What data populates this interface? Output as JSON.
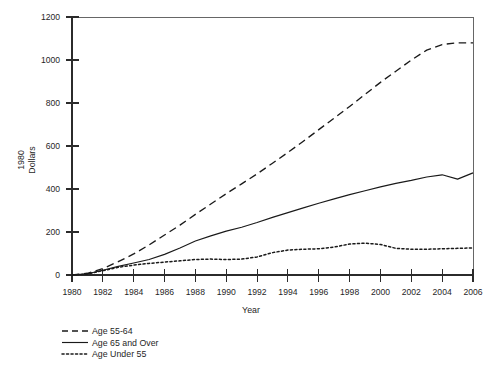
{
  "chart_data": {
    "type": "line",
    "title": "",
    "xlabel": "Year",
    "ylabel": "1980 Dollars",
    "ylabel_lines": [
      "1980",
      "Dollars"
    ],
    "xlim": [
      1980,
      2006
    ],
    "ylim": [
      0,
      1200
    ],
    "grid": false,
    "legend_position": "below-left",
    "xticks": [
      1980,
      1982,
      1984,
      1986,
      1988,
      1990,
      1992,
      1994,
      1996,
      1998,
      2000,
      2002,
      2004,
      2006
    ],
    "xtick_labels": [
      "1980",
      "1982",
      "1984",
      "1986",
      "1988",
      "1990",
      "1992",
      "1994",
      "1996",
      "1998",
      "2000",
      "2002",
      "2004",
      "2006"
    ],
    "yticks": [
      0,
      200,
      400,
      600,
      800,
      1000,
      1200
    ],
    "ytick_labels": [
      "0",
      "200",
      "400",
      "600",
      "800",
      "1000",
      "1200"
    ],
    "x": [
      1980,
      1981,
      1982,
      1983,
      1984,
      1985,
      1986,
      1987,
      1988,
      1989,
      1990,
      1991,
      1992,
      1993,
      1994,
      1995,
      1996,
      1997,
      1998,
      1999,
      2000,
      2001,
      2002,
      2003,
      2004,
      2005,
      2006
    ],
    "series": [
      {
        "name": "Age 55-64",
        "style": "dashed",
        "color": "#1a1a1a",
        "values": [
          0,
          8,
          30,
          62,
          98,
          140,
          186,
          232,
          282,
          330,
          378,
          424,
          470,
          520,
          570,
          622,
          676,
          730,
          784,
          840,
          896,
          948,
          1000,
          1046,
          1072,
          1080,
          1080
        ]
      },
      {
        "name": "Age 65 and Over",
        "style": "solid",
        "color": "#1a1a1a",
        "values": [
          0,
          6,
          22,
          40,
          56,
          72,
          96,
          126,
          158,
          182,
          204,
          222,
          244,
          268,
          290,
          312,
          334,
          354,
          374,
          392,
          410,
          426,
          440,
          456,
          466,
          446,
          475
        ]
      },
      {
        "name": "Age Under 55",
        "style": "dotted",
        "color": "#1a1a1a",
        "values": [
          0,
          5,
          20,
          36,
          46,
          54,
          60,
          66,
          72,
          74,
          72,
          74,
          84,
          104,
          116,
          120,
          122,
          130,
          144,
          148,
          142,
          124,
          120,
          120,
          122,
          124,
          126
        ]
      }
    ]
  },
  "legend": {
    "items": [
      {
        "label": "Age  55-64",
        "style": "dashed"
      },
      {
        "label": "Age  65  and  Over",
        "style": "solid"
      },
      {
        "label": "Age Under 55",
        "style": "dotted"
      }
    ]
  }
}
